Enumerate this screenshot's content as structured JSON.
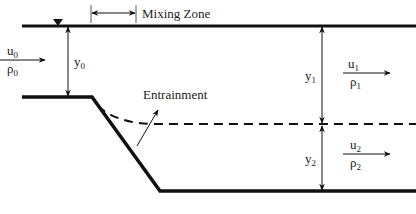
{
  "diagram": {
    "type": "stratified flow mixing zone schematic",
    "labels": {
      "mixing_zone": "Mixing Zone",
      "entrainment": "Entrainment",
      "u0": "u",
      "u0_sub": "0",
      "rho0": "ρ",
      "rho0_sub": "0",
      "y0": "y",
      "y0_sub": "0",
      "y1": "y",
      "y1_sub": "1",
      "u1": "u",
      "u1_sub": "1",
      "rho1": "ρ",
      "rho1_sub": "1",
      "y2": "y",
      "y2_sub": "2",
      "u2": "u",
      "u2_sub": "2",
      "rho2": "ρ",
      "rho2_sub": "2"
    },
    "colors": {
      "line": "#111111",
      "text": "#222222",
      "background": "#ffffff"
    }
  }
}
